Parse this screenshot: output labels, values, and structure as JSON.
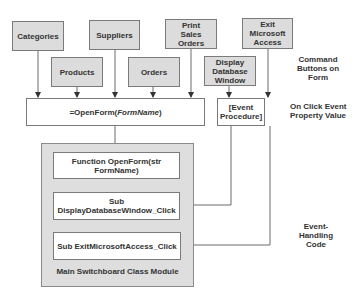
{
  "command_buttons": {
    "categories": "Categories",
    "suppliers": "Suppliers",
    "print_sales_orders": "Print Sales Orders",
    "exit_microsoft_access": "Exit Microsoft Access",
    "products": "Products",
    "orders": "Orders",
    "display_database_window": "Display Database Window"
  },
  "property_values": {
    "openform_prefix": "=OpenForm(",
    "openform_arg": "FormName",
    "openform_suffix": ")",
    "event_procedure": "[Event Procedure]"
  },
  "module": {
    "function_openform": "Function OpenForm(str FormName)",
    "sub_display": "Sub DisplayDatabaseWindow_Click",
    "sub_exit": "Sub ExitMicrosoftAccess_Click",
    "title": "Main Switchboard Class Module"
  },
  "annotations": {
    "command_buttons": "Command Buttons on Form",
    "on_click": "On Click Event Property Value",
    "event_handling": "Event-Handling Code"
  },
  "colors": {
    "button_fill": "#dcdcdc",
    "module_fill": "#dedede",
    "line": "#6a6a6a"
  }
}
